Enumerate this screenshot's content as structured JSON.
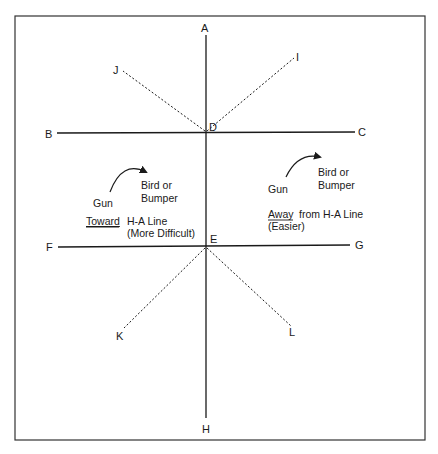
{
  "diagram": {
    "points": {
      "A": "A",
      "B": "B",
      "C": "C",
      "D": "D",
      "E": "E",
      "F": "F",
      "G": "G",
      "H": "H",
      "I": "I",
      "J": "J",
      "K": "K",
      "L": "L"
    },
    "left_example": {
      "gun": "Gun",
      "target_line1": "Bird or",
      "target_line2": "Bumper",
      "direction_word": "Toward",
      "direction_rest": "H-A Line",
      "difficulty": "(More Difficult)"
    },
    "right_example": {
      "gun": "Gun",
      "target_line1": "Bird or",
      "target_line2": "Bumper",
      "direction_word": "Away",
      "direction_rest": "from H-A Line",
      "difficulty": "(Easier)"
    },
    "colors": {
      "line": "#1a1a1a",
      "border": "#333333"
    }
  }
}
